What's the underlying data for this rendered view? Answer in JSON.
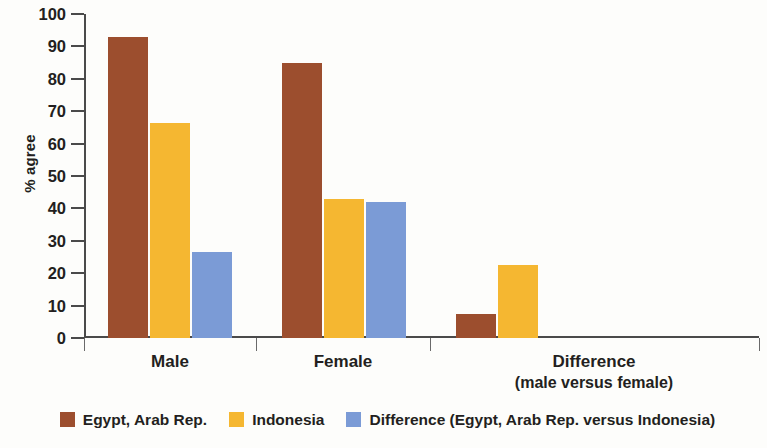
{
  "chart_data": {
    "type": "bar",
    "title": "",
    "subtitle": "",
    "xlabel": "",
    "ylabel": "% agree",
    "ylim": [
      0,
      100
    ],
    "ytick_step": 10,
    "yticks": [
      "100",
      "90",
      "80",
      "70",
      "60",
      "50",
      "40",
      "30",
      "20",
      "10",
      "0"
    ],
    "grid": false,
    "legend_position": "bottom",
    "categories": [
      "Male",
      "Female",
      "Difference"
    ],
    "category_sublabels": [
      "",
      "",
      "(male versus female)"
    ],
    "series": [
      {
        "name": "Egypt, Arab Rep.",
        "color": "#9c4e2e",
        "values": [
          93,
          85,
          7.5
        ]
      },
      {
        "name": "Indonesia",
        "color": "#f5b731",
        "values": [
          66.5,
          43,
          22.5
        ]
      },
      {
        "name": "Difference (Egypt,  Arab Rep. versus Indonesia)",
        "color": "#7b9bd6",
        "values": [
          26.5,
          42,
          null
        ]
      }
    ]
  },
  "axis": {
    "y_title": "% agree",
    "ticks": [
      {
        "label": "100",
        "value": 100
      },
      {
        "label": "90",
        "value": 90
      },
      {
        "label": "80",
        "value": 80
      },
      {
        "label": "70",
        "value": 70
      },
      {
        "label": "60",
        "value": 60
      },
      {
        "label": "50",
        "value": 50
      },
      {
        "label": "40",
        "value": 40
      },
      {
        "label": "30",
        "value": 30
      },
      {
        "label": "20",
        "value": 20
      },
      {
        "label": "10",
        "value": 10
      },
      {
        "label": "0",
        "value": 0
      }
    ]
  },
  "categories": [
    {
      "label": "Male",
      "sublabel": ""
    },
    {
      "label": "Female",
      "sublabel": ""
    },
    {
      "label": "Difference",
      "sublabel": "(male versus female)"
    }
  ],
  "legend": {
    "items": [
      {
        "label": "Egypt, Arab Rep.",
        "color": "#9c4e2e"
      },
      {
        "label": "Indonesia",
        "color": "#f5b731"
      },
      {
        "label": "Difference (Egypt,  Arab Rep. versus Indonesia)",
        "color": "#7b9bd6"
      }
    ]
  }
}
